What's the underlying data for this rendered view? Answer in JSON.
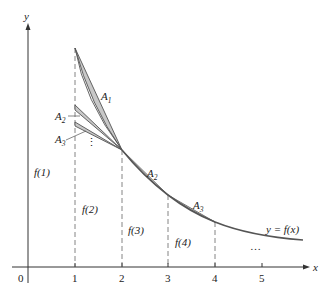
{
  "diagram": {
    "axes": {
      "x_label": "x",
      "y_label": "y",
      "origin_label": "0",
      "x_ticks": [
        "1",
        "2",
        "3",
        "4",
        "5"
      ]
    },
    "curve_label": "y = f(x)",
    "value_labels": [
      "f(1)",
      "f(2)",
      "f(3)",
      "f(4)"
    ],
    "area_labels": {
      "a1": "A",
      "a1_sub": "1",
      "a2_left": "A",
      "a2_left_sub": "2",
      "a3_left": "A",
      "a3_left_sub": "3",
      "a2_right": "A",
      "a2_right_sub": "2",
      "a3_right": "A",
      "a3_right_sub": "3"
    },
    "ellipsis_left": "⋮",
    "ellipsis_right": "…",
    "colors": {
      "axis": "#333333",
      "curve": "#555555",
      "shade": "#c8c8c8",
      "dashed": "#666666"
    }
  }
}
